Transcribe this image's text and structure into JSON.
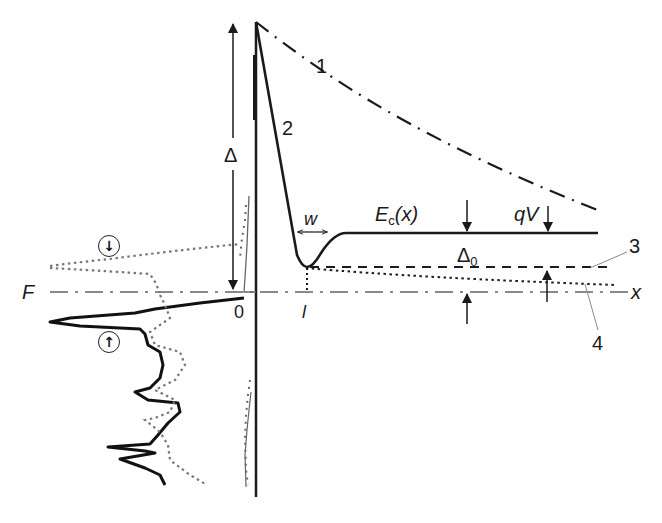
{
  "diagram": {
    "type": "energy band diagram",
    "labels": {
      "curve_1": "1",
      "curve_2": "2",
      "line_3": "3",
      "line_4": "4",
      "delta": "Δ",
      "delta_0_main": "Δ",
      "delta_0_sub": "0",
      "fermi": "F",
      "x_axis": "x",
      "origin": "0",
      "l_mark": "l",
      "w_mark": "w",
      "ec_main": "E",
      "ec_sub": "c",
      "ec_arg": "(x)",
      "qv": "qV"
    },
    "spin_markers": {
      "spin_down": "↓",
      "spin_up": "↑"
    },
    "colors": {
      "ink": "#1a1a1a",
      "fermi_line": "#8a8a8a",
      "dos_dotted": "#777777",
      "leader_line": "#8a8a8a"
    }
  }
}
